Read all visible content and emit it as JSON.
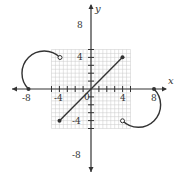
{
  "graph": {
    "x_axis_label": "x",
    "y_axis_label": "y",
    "origin_label": "0",
    "x_tick_labels": [
      "-8",
      "-4",
      "4",
      "8"
    ],
    "y_tick_labels": [
      "8",
      "4",
      "-4",
      "-8"
    ],
    "xlim": [
      -10,
      10
    ],
    "ylim": [
      -10,
      10
    ],
    "grid_step": 1,
    "colors": {
      "grid": "#c8c8c8",
      "axis": "#333333",
      "curve": "#333333"
    }
  },
  "pieces": [
    {
      "type": "quarter-circle-arc",
      "from": [
        -8,
        0
      ],
      "to": [
        -4,
        4
      ],
      "start": "closed",
      "end": "open"
    },
    {
      "type": "line-segment",
      "from": [
        -4,
        -4
      ],
      "to": [
        4,
        4
      ],
      "start": "closed",
      "end": "closed"
    },
    {
      "type": "quarter-circle-arc",
      "from": [
        4,
        -4
      ],
      "to": [
        8,
        0
      ],
      "start": "open",
      "end": "closed"
    }
  ]
}
